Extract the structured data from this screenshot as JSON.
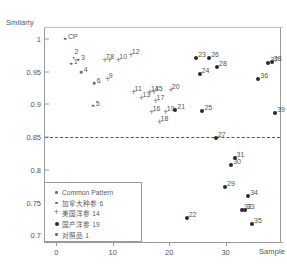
{
  "chart_data": {
    "type": "scatter",
    "title": "",
    "xlabel": "Sample",
    "ylabel": "Smilarty",
    "xlim": [
      -2,
      40
    ],
    "ylim": [
      0.69,
      1.018
    ],
    "xticks": [
      "0",
      "10",
      "20",
      "30"
    ],
    "xtick_values": [
      0,
      10,
      20,
      30
    ],
    "yticks": [
      "1",
      "0.95",
      "0.9",
      "0.85",
      "0.8",
      "0.75",
      "0.7"
    ],
    "ytick_values": [
      1,
      0.95,
      0.9,
      0.85,
      0.8,
      0.75,
      0.7
    ],
    "grid": false,
    "legend_position": "lower-left",
    "threshold": {
      "value": 0.85,
      "style": "dashed",
      "label": ""
    },
    "series": [
      {
        "name": "Common Pattern",
        "marker": "dot-small",
        "count": 1,
        "points": [
          {
            "label": "CP",
            "x": 1.6,
            "y": 1.0,
            "label_pos": "right"
          }
        ]
      },
      {
        "name": "加拿大种参",
        "count": 6,
        "marker": "dot-small",
        "points": [
          {
            "label": "1",
            "x": 2.6,
            "y": 0.962,
            "label_pos": "right"
          },
          {
            "label": "2",
            "x": 3.1,
            "y": 0.971,
            "label_pos": "up"
          },
          {
            "label": "3",
            "x": 3.9,
            "y": 0.968,
            "label_pos": "right"
          },
          {
            "label": "4",
            "x": 4.4,
            "y": 0.949,
            "label_pos": "right"
          },
          {
            "label": "5",
            "x": 6.5,
            "y": 0.898,
            "label_pos": "right"
          },
          {
            "label": "6",
            "x": 6.7,
            "y": 0.932,
            "label_pos": "right"
          }
        ]
      },
      {
        "name": "美国洋参",
        "count": 14,
        "marker": "plus",
        "points": [
          {
            "label": "7",
            "x": 8.6,
            "y": 0.967,
            "label_pos": "right"
          },
          {
            "label": "8",
            "x": 9.4,
            "y": 0.968,
            "label_pos": "right"
          },
          {
            "label": "9",
            "x": 9.1,
            "y": 0.938,
            "label_pos": "right"
          },
          {
            "label": "10",
            "x": 11.0,
            "y": 0.968,
            "label_pos": "right"
          },
          {
            "label": "11",
            "x": 13.7,
            "y": 0.919,
            "label_pos": "right"
          },
          {
            "label": "12",
            "x": 13.2,
            "y": 0.976,
            "label_pos": "right"
          },
          {
            "label": "13",
            "x": 15.1,
            "y": 0.909,
            "label_pos": "right"
          },
          {
            "label": "14",
            "x": 16.6,
            "y": 0.919,
            "label_pos": "right"
          },
          {
            "label": "15",
            "x": 17.3,
            "y": 0.919,
            "label_pos": "right"
          },
          {
            "label": "16",
            "x": 16.9,
            "y": 0.888,
            "label_pos": "right"
          },
          {
            "label": "17",
            "x": 17.6,
            "y": 0.905,
            "label_pos": "right"
          },
          {
            "label": "18",
            "x": 18.3,
            "y": 0.873,
            "label_pos": "right"
          },
          {
            "label": "19",
            "x": 19.4,
            "y": 0.888,
            "label_pos": "right"
          },
          {
            "label": "20",
            "x": 20.3,
            "y": 0.922,
            "label_pos": "right"
          }
        ]
      },
      {
        "name": "国产洋参",
        "count": 19,
        "marker": "dot-big",
        "points": [
          {
            "label": "21",
            "x": 21.1,
            "y": 0.891,
            "label_pos": "right"
          },
          {
            "label": "22",
            "x": 23.1,
            "y": 0.726,
            "label_pos": "right"
          },
          {
            "label": "23",
            "x": 24.8,
            "y": 0.971,
            "label_pos": "right"
          },
          {
            "label": "24",
            "x": 25.4,
            "y": 0.947,
            "label_pos": "right"
          },
          {
            "label": "25",
            "x": 25.9,
            "y": 0.89,
            "label_pos": "right"
          },
          {
            "label": "26",
            "x": 27.1,
            "y": 0.97,
            "label_pos": "right"
          },
          {
            "label": "27",
            "x": 28.3,
            "y": 0.848,
            "label_pos": "right"
          },
          {
            "label": "28",
            "x": 28.5,
            "y": 0.957,
            "label_pos": "right"
          },
          {
            "label": "29",
            "x": 29.9,
            "y": 0.774,
            "label_pos": "right"
          },
          {
            "label": "30",
            "x": 31.0,
            "y": 0.808,
            "label_pos": "right"
          },
          {
            "label": "31",
            "x": 31.6,
            "y": 0.818,
            "label_pos": "right"
          },
          {
            "label": "32",
            "x": 32.9,
            "y": 0.739,
            "label_pos": "right"
          },
          {
            "label": "33",
            "x": 33.4,
            "y": 0.739,
            "label_pos": "right"
          },
          {
            "label": "34",
            "x": 34.0,
            "y": 0.76,
            "label_pos": "right"
          },
          {
            "label": "35",
            "x": 34.7,
            "y": 0.718,
            "label_pos": "right"
          },
          {
            "label": "36",
            "x": 35.8,
            "y": 0.938,
            "label_pos": "right"
          },
          {
            "label": "37",
            "x": 37.6,
            "y": 0.963,
            "label_pos": "right"
          },
          {
            "label": "38",
            "x": 38.2,
            "y": 0.965,
            "label_pos": "right"
          },
          {
            "label": "39",
            "x": 38.8,
            "y": 0.887,
            "label_pos": "right"
          }
        ]
      },
      {
        "name": "对照品",
        "count": 1,
        "marker": "dot-small",
        "points": []
      }
    ]
  },
  "legend": {
    "rows": [
      {
        "marker": "dot-small",
        "label": "Common Pattern"
      },
      {
        "marker": "dot-small",
        "label": "加拿大种参  6"
      },
      {
        "marker": "plus",
        "label": "美国洋参  14"
      },
      {
        "marker": "dot-big",
        "label": "国产洋参  19"
      },
      {
        "marker": "dot-small",
        "label": "对照品  1"
      }
    ]
  },
  "colors": {
    "axis": "#9a9a9a",
    "text": "#555555",
    "marker_light": "#6f6f6f",
    "marker_dark": "#2b2b2b",
    "threshold": "#555555"
  }
}
